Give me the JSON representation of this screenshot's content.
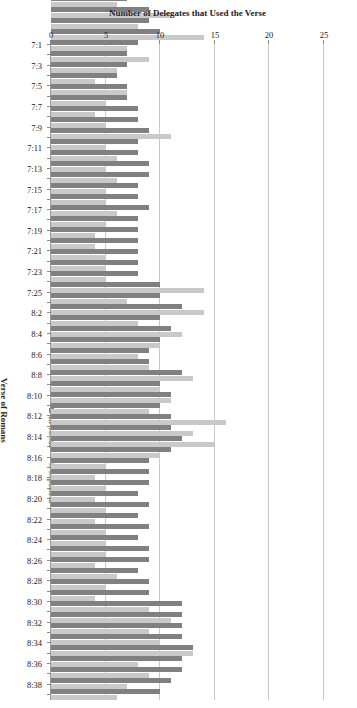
{
  "chart_data": {
    "type": "bar",
    "orientation": "horizontal",
    "title": "",
    "xlabel": "Number of Delegates that Used the Verse",
    "ylabel": "Verse of Romans",
    "xlim": [
      0,
      25
    ],
    "xticks": [
      25,
      20,
      15,
      10,
      5,
      0
    ],
    "grid": true,
    "axis_reversed": true,
    "legend_position": "left-rotated",
    "colors": {
      "Liwonde": "#808080",
      "Mponela": "#c9c9c9"
    },
    "categories": [
      "8:39",
      "8:38",
      "8:37",
      "8:36",
      "8:35",
      "8:34",
      "8:33",
      "8:32",
      "8:31",
      "8:30",
      "8:29",
      "8:28",
      "8:27",
      "8:26",
      "8:25",
      "8:24",
      "8:23",
      "8:22",
      "8:21",
      "8:20",
      "8:19",
      "8:18",
      "8:17",
      "8:16",
      "8:15",
      "8:14",
      "8:13",
      "8:12",
      "8:11",
      "8:10",
      "8:9",
      "8:8",
      "8:7",
      "8:6",
      "8:5",
      "8:4",
      "8:3",
      "8:2",
      "8:1",
      "7:25",
      "7:24",
      "7:23",
      "7:22",
      "7:21",
      "7:20",
      "7:19",
      "7:18",
      "7:17",
      "7:16",
      "7:15",
      "7:14",
      "7:13",
      "7:12",
      "7:11",
      "7:10",
      "7:9",
      "7:8",
      "7:7",
      "7:6",
      "7:5",
      "7:4",
      "7:3",
      "7:2",
      "7:1"
    ],
    "tick_labels": [
      "",
      "8:38",
      "",
      "8:36",
      "",
      "8:34",
      "",
      "8:32",
      "",
      "8:30",
      "",
      "8:28",
      "",
      "8:26",
      "",
      "8:24",
      "",
      "8:22",
      "",
      "8:20",
      "",
      "8:18",
      "",
      "8:16",
      "",
      "8:14",
      "",
      "8:12",
      "",
      "8:10",
      "",
      "8:8",
      "",
      "8:6",
      "",
      "8:4",
      "",
      "8:2",
      "",
      "7:25",
      "",
      "7:23",
      "",
      "7:21",
      "",
      "7:19",
      "",
      "7:17",
      "",
      "7:15",
      "",
      "7:13",
      "",
      "7:11",
      "",
      "7:9",
      "",
      "7:7",
      "",
      "7:5",
      "",
      "7:3",
      "",
      "7:1"
    ],
    "series": [
      {
        "name": "Liwonde",
        "color": "#808080",
        "values": [
          10,
          11,
          12,
          12,
          13,
          12,
          12,
          12,
          12,
          9,
          9,
          8,
          9,
          9,
          8,
          9,
          8,
          9,
          8,
          9,
          9,
          9,
          11,
          12,
          11,
          11,
          10,
          11,
          10,
          12,
          9,
          9,
          10,
          11,
          10,
          12,
          10,
          10,
          8,
          8,
          8,
          8,
          8,
          8,
          9,
          8,
          8,
          9,
          9,
          8,
          8,
          9,
          8,
          8,
          7,
          7,
          6,
          7,
          7,
          8,
          10,
          9,
          9,
          7
        ]
      },
      {
        "name": "Mponela",
        "color": "#c9c9c9",
        "values": [
          6,
          7,
          9,
          8,
          13,
          10,
          9,
          11,
          9,
          4,
          5,
          6,
          4,
          5,
          5,
          5,
          4,
          5,
          4,
          5,
          4,
          5,
          10,
          15,
          13,
          16,
          9,
          11,
          10,
          13,
          9,
          8,
          10,
          12,
          8,
          14,
          7,
          14,
          5,
          5,
          5,
          4,
          4,
          5,
          6,
          5,
          5,
          6,
          5,
          6,
          5,
          11,
          5,
          4,
          5,
          7,
          4,
          6,
          9,
          7,
          14,
          8,
          11,
          6
        ]
      }
    ]
  },
  "legend": {
    "items": [
      {
        "label": "Liwonde",
        "color": "#808080"
      },
      {
        "label": "Mponela",
        "color": "#c9c9c9"
      }
    ]
  },
  "axes": {
    "value_axis_title": "Number of Delegates that Used the Verse",
    "category_axis_title": "Verse of Romans"
  }
}
